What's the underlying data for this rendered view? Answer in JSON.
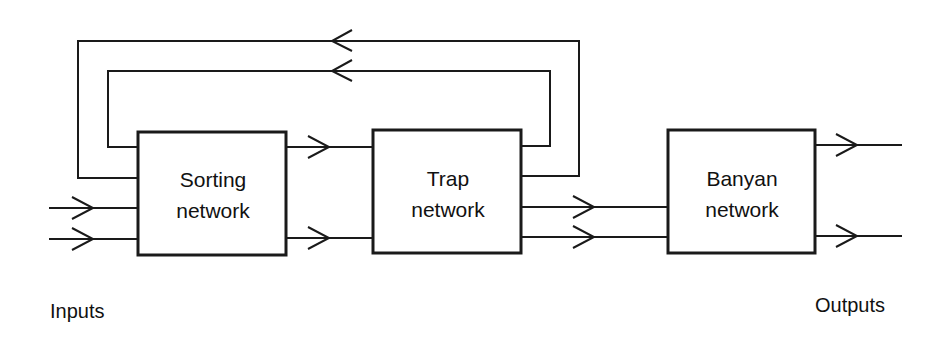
{
  "diagram": {
    "blocks": [
      {
        "id": "sorting",
        "line1": "Sorting",
        "line2": "network"
      },
      {
        "id": "trap",
        "line1": "Trap",
        "line2": "network"
      },
      {
        "id": "banyan",
        "line1": "Banyan",
        "line2": "network"
      }
    ],
    "labels": {
      "inputs": "Inputs",
      "outputs": "Outputs"
    },
    "connections": [
      {
        "from": "inputs",
        "to": "sorting",
        "count": 2
      },
      {
        "from": "sorting",
        "to": "trap",
        "count": 2
      },
      {
        "from": "trap",
        "to": "banyan",
        "count": 2
      },
      {
        "from": "banyan",
        "to": "outputs",
        "count": 2
      },
      {
        "from": "trap",
        "to": "sorting",
        "count": 2,
        "type": "feedback"
      }
    ],
    "colors": {
      "stroke": "#1a1a1a",
      "background": "#ffffff"
    }
  }
}
